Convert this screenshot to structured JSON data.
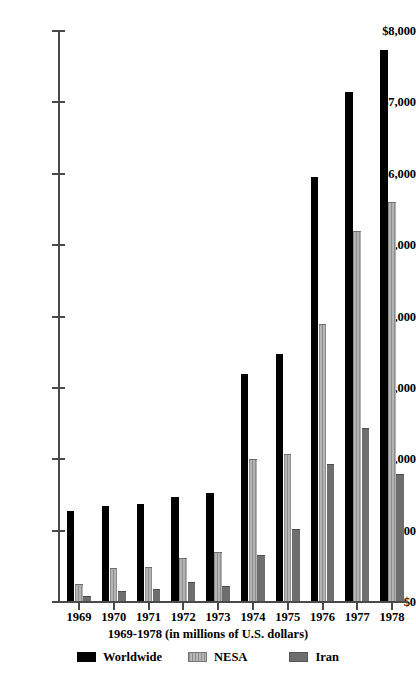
{
  "chart_data": {
    "type": "bar",
    "title": "",
    "xlabel": "1969-1978 (in millions of U.S. dollars)",
    "ylabel": "",
    "ylim": [
      0,
      8000
    ],
    "ytick_labels": [
      "$8,000",
      "$7,000",
      "$6,000",
      "$5,000",
      "$4,000",
      "$3,000",
      "$2,000",
      "$1,000",
      "$0"
    ],
    "ytick_values": [
      8000,
      7000,
      6000,
      5000,
      4000,
      3000,
      2000,
      1000,
      0
    ],
    "grid": false,
    "legend_position": "bottom",
    "categories": [
      "1969",
      "1970",
      "1971",
      "1972",
      "1973",
      "1974",
      "1975",
      "1976",
      "1977",
      "1978"
    ],
    "series": [
      {
        "name": "Worldwide",
        "color": "#000000",
        "values": [
          1280,
          1350,
          1380,
          1470,
          1530,
          3200,
          3480,
          5960,
          7150,
          7740
        ]
      },
      {
        "name": "NESA",
        "color": "#9a9a9a",
        "values": [
          250,
          470,
          490,
          610,
          700,
          2000,
          2080,
          3890,
          5200,
          5600
        ]
      },
      {
        "name": "Iran",
        "color": "#6e6e6e",
        "values": [
          90,
          150,
          180,
          280,
          230,
          660,
          1020,
          1930,
          2440,
          1800
        ]
      }
    ]
  },
  "legend": {
    "items": [
      {
        "label": "Worldwide"
      },
      {
        "label": "NESA"
      },
      {
        "label": "Iran"
      }
    ]
  }
}
